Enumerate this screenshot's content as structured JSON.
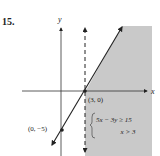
{
  "problem": {
    "number": "15."
  },
  "axes": {
    "x_label": "x",
    "y_label": "y"
  },
  "points": [
    {
      "label": "(3, 0)",
      "x": 3,
      "y": 0
    },
    {
      "label": "(0, −5)",
      "x": 0,
      "y": -5
    }
  ],
  "system": {
    "inequality_1": "5x − 3y ≥ 15",
    "inequality_2": "x > 3"
  },
  "colors": {
    "shade": "#c9c9c9",
    "line": "#222222",
    "axis": "#333333"
  }
}
